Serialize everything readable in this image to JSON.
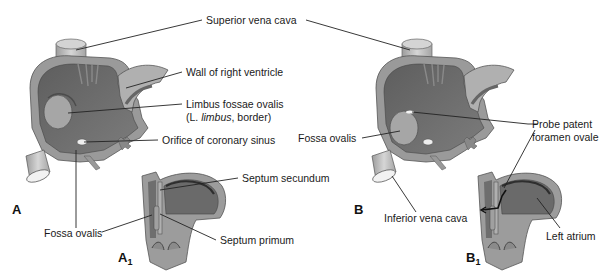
{
  "figure": {
    "panels": [
      {
        "id": "A",
        "label": "A",
        "sub": ""
      },
      {
        "id": "A1",
        "label": "A",
        "sub": "1"
      },
      {
        "id": "B",
        "label": "B",
        "sub": ""
      },
      {
        "id": "B1",
        "label": "B",
        "sub": "1"
      }
    ],
    "labels": {
      "superior_vena_cava": "Superior vena cava",
      "wall_right_ventricle": "Wall of right ventricle",
      "limbus_line1": "Limbus fossae ovalis",
      "limbus_line2_pre": "(L. ",
      "limbus_line2_italic": "limbus",
      "limbus_line2_post": ", border)",
      "orifice_coronary_sinus": "Orifice of coronary sinus",
      "septum_secundum": "Septum secundum",
      "septum_primum": "Septum primum",
      "fossa_ovalis_a": "Fossa ovalis",
      "fossa_ovalis_b": "Fossa ovalis",
      "inferior_vena_cava": "Inferior vena cava",
      "probe_line1": "Probe patent",
      "probe_line2": "foramen ovale",
      "left_atrium": "Left atrium"
    },
    "colors": {
      "background": "#ffffff",
      "wall_outer": "#9a9a9a",
      "chamber_dark": "#6e6e6e",
      "wall_light": "#b8b8b8",
      "vessel": "#c8c8c8",
      "leader": "#222222"
    }
  }
}
